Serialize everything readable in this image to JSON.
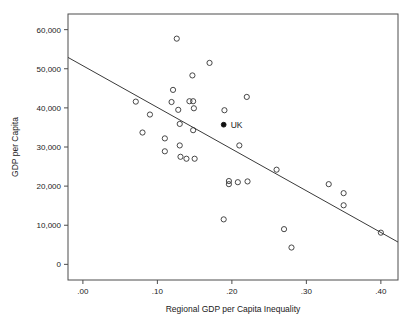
{
  "figure": {
    "cropped_title_fragment": "",
    "background": "#ffffff",
    "frame_color": "#4d4d4d",
    "marker_color": "#333333",
    "highlight_color": "#111111",
    "line_color": "#3a3a3a"
  },
  "chart_data": {
    "type": "scatter",
    "title": "",
    "xlabel": "Regional GDP per Capita Inequality",
    "ylabel": "GDP per Capita",
    "xlim": [
      -0.02,
      0.423
    ],
    "ylim": [
      -4000,
      64000
    ],
    "grid": false,
    "legend": "none",
    "xticks": [
      0.0,
      0.1,
      0.2,
      0.3,
      0.4
    ],
    "xticklabels": [
      ".00",
      ".10",
      ".20",
      ".30",
      ".40"
    ],
    "yticks": [
      0,
      10000,
      20000,
      30000,
      40000,
      50000,
      60000
    ],
    "yticklabels": [
      "0",
      "10,000",
      "20,000",
      "30,000",
      "40,000",
      "50,000",
      "60,000"
    ],
    "series": [
      {
        "name": "countries",
        "marker": "open-circle",
        "points": [
          {
            "x": 0.071,
            "y": 41600
          },
          {
            "x": 0.08,
            "y": 33700
          },
          {
            "x": 0.09,
            "y": 38300
          },
          {
            "x": 0.11,
            "y": 32200
          },
          {
            "x": 0.11,
            "y": 28900
          },
          {
            "x": 0.119,
            "y": 41500
          },
          {
            "x": 0.121,
            "y": 44600
          },
          {
            "x": 0.126,
            "y": 57700
          },
          {
            "x": 0.128,
            "y": 39500
          },
          {
            "x": 0.13,
            "y": 35900
          },
          {
            "x": 0.13,
            "y": 30400
          },
          {
            "x": 0.131,
            "y": 27500
          },
          {
            "x": 0.139,
            "y": 27000
          },
          {
            "x": 0.143,
            "y": 41700
          },
          {
            "x": 0.147,
            "y": 48300
          },
          {
            "x": 0.148,
            "y": 41700
          },
          {
            "x": 0.149,
            "y": 39900
          },
          {
            "x": 0.148,
            "y": 34300
          },
          {
            "x": 0.15,
            "y": 27000
          },
          {
            "x": 0.17,
            "y": 51500
          },
          {
            "x": 0.19,
            "y": 39400
          },
          {
            "x": 0.189,
            "y": 11500
          },
          {
            "x": 0.196,
            "y": 21300
          },
          {
            "x": 0.196,
            "y": 20500
          },
          {
            "x": 0.208,
            "y": 21000
          },
          {
            "x": 0.21,
            "y": 30400
          },
          {
            "x": 0.22,
            "y": 42800
          },
          {
            "x": 0.221,
            "y": 21200
          },
          {
            "x": 0.26,
            "y": 24200
          },
          {
            "x": 0.27,
            "y": 9000
          },
          {
            "x": 0.28,
            "y": 4300
          },
          {
            "x": 0.33,
            "y": 20500
          },
          {
            "x": 0.35,
            "y": 18200
          },
          {
            "x": 0.35,
            "y": 15100
          },
          {
            "x": 0.4,
            "y": 8100
          }
        ]
      },
      {
        "name": "UK",
        "marker": "filled-circle",
        "label": "UK",
        "points": [
          {
            "x": 0.189,
            "y": 35700
          }
        ]
      }
    ],
    "fit_line": {
      "x0": -0.02,
      "y0": 52900,
      "x1": 0.423,
      "y1": 5700
    }
  }
}
